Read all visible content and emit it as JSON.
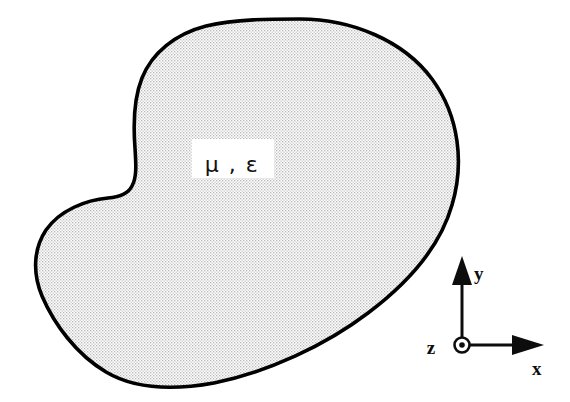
{
  "figure": {
    "background_color": "#ffffff",
    "region": {
      "name": "material-region",
      "fill_color": "#e9e9e9",
      "fill_pattern": "dither-halftone",
      "outline_color": "#000000",
      "outline_width": 3.6,
      "path": "M 300 19 C 352 19 404 41 432 79 C 460 117 464 165 452 205 C 440 247 408 283 368 313 C 326 345 268 372 214 383 C 170 391 133 388 106 372 C 76 354 54 324 42 296 C 32 272 34 248 46 230 C 60 210 86 200 108 198 C 120 197 128 194 132 186 C 137 177 136 164 135 148 C 133 122 134 98 142 78 C 152 53 175 34 206 26 C 236 19 270 19 300 19 Z"
    },
    "material_label": {
      "name": "material-parameters-label",
      "text": "μ , ε",
      "permeability_symbol": "μ",
      "permittivity_symbol": "ε",
      "separator": ",",
      "box_fill": "#ffffff",
      "x": 232,
      "y": 165
    },
    "axes": {
      "name": "coordinate-triad",
      "origin": {
        "x": 462,
        "y": 345
      },
      "stroke_color": "#0d0d0d",
      "y_axis": {
        "label": "y",
        "direction": "up",
        "tip_y": 258,
        "label_x": 474,
        "label_y": 279
      },
      "x_axis": {
        "label": "x",
        "direction": "right",
        "tip_x": 544,
        "label_x": 532,
        "label_y": 373
      },
      "z_axis": {
        "label": "z",
        "direction": "out-of-page",
        "symbol": "circle-dot",
        "label_x": 431,
        "label_y": 353
      }
    }
  }
}
